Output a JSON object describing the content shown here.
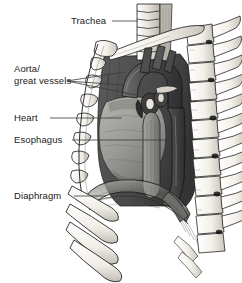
{
  "figure": {
    "background_color": "#ffffff",
    "width": 242,
    "height": 283
  },
  "labels": [
    {
      "id": "trachea",
      "text": "Trachea",
      "x": 71,
      "y": 24,
      "leader": {
        "x1": 112,
        "y1": 21,
        "x2": 138,
        "y2": 21
      }
    },
    {
      "id": "aorta-great-vessels",
      "line1": "Aorta/",
      "line2": "great vessels",
      "x": 14,
      "y": 72,
      "leader_fan": true
    },
    {
      "id": "heart",
      "text": "Heart",
      "x": 14,
      "y": 121,
      "leader": {
        "x1": 50,
        "y1": 118,
        "x2": 122,
        "y2": 118
      }
    },
    {
      "id": "esophagus",
      "text": "Esophagus",
      "x": 14,
      "y": 143,
      "leader": {
        "x1": 72,
        "y1": 140,
        "x2": 166,
        "y2": 140
      }
    },
    {
      "id": "diaphragm",
      "text": "Diaphragm",
      "x": 14,
      "y": 199,
      "leader": {
        "x1": 74,
        "y1": 196,
        "x2": 106,
        "y2": 196
      }
    }
  ],
  "structures": [
    {
      "id": "trachea",
      "name": "Trachea",
      "tone": "#d8d4cb"
    },
    {
      "id": "aortic-arch",
      "name": "Aortic arch",
      "tone": "#4a4a4a"
    },
    {
      "id": "great-vessels",
      "name": "Great vessels",
      "tone": "#5a5a5a"
    },
    {
      "id": "heart",
      "name": "Heart",
      "tone": "#9a9a96"
    },
    {
      "id": "esophagus",
      "name": "Esophagus",
      "tone": "#8d8d88"
    },
    {
      "id": "descending-aorta",
      "name": "Descending aorta",
      "tone": "#5f5f5f"
    },
    {
      "id": "diaphragm",
      "name": "Diaphragm",
      "tone": "#8a8a86"
    },
    {
      "id": "ribs",
      "name": "Ribs",
      "tone": "#f2efe8"
    },
    {
      "id": "vertebrae",
      "name": "Vertebral column",
      "tone": "#f4f1ea"
    },
    {
      "id": "clavicle",
      "name": "Clavicle",
      "tone": "#f2efe8"
    },
    {
      "id": "sternum",
      "name": "Sternum",
      "tone": "#ece8e0"
    }
  ],
  "colors": {
    "line": "#1a1a1a",
    "leader": "#3a3a3a",
    "bone_fill": "#f4f1ea",
    "bone_shade": "#bdb9b0",
    "cavity_dark": "#4f4f4f",
    "heart_fill": "#9a9a96",
    "aorta_fill": "#565656",
    "text": "#1a1a1a"
  }
}
